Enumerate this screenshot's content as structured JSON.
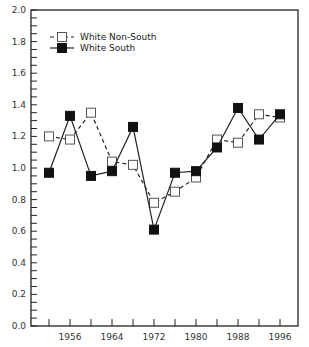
{
  "chart_data": {
    "type": "line",
    "title": "",
    "xlabel": "",
    "ylabel": "",
    "x": [
      1952,
      1956,
      1960,
      1964,
      1968,
      1972,
      1976,
      1980,
      1984,
      1988,
      1992,
      1996
    ],
    "series": [
      {
        "name": "White Non-South",
        "marker": "hollow-square",
        "line": "dashed",
        "values": [
          1.2,
          1.18,
          1.35,
          1.04,
          1.02,
          0.78,
          0.85,
          0.94,
          1.18,
          1.16,
          1.34,
          1.32
        ]
      },
      {
        "name": "White South",
        "marker": "filled-square",
        "line": "solid",
        "values": [
          0.97,
          1.33,
          0.95,
          0.98,
          1.26,
          0.61,
          0.97,
          0.98,
          1.13,
          1.38,
          1.18,
          1.34
        ]
      }
    ],
    "ylim": [
      0.0,
      2.0
    ],
    "xlim": [
      1948,
      1999
    ],
    "yticks": [
      "0.0",
      "0.2",
      "0.4",
      "0.6",
      "0.8",
      "1.0",
      "1.2",
      "1.4",
      "1.6",
      "1.8",
      "2.0"
    ],
    "xtick_labels": [
      "1956",
      "1964",
      "1972",
      "1980",
      "1988",
      "1996"
    ],
    "xtick_positions": [
      1952,
      1956,
      1960,
      1964,
      1968,
      1972,
      1976,
      1980,
      1984,
      1988,
      1992,
      1996
    ],
    "y_minor_step": 0.05,
    "grid": false,
    "legend_position": "upper-left",
    "colors": {
      "axis": "#222222",
      "line": "#222222",
      "marker_fill_solid": "#111111",
      "marker_fill_hollow": "#ffffff"
    }
  }
}
